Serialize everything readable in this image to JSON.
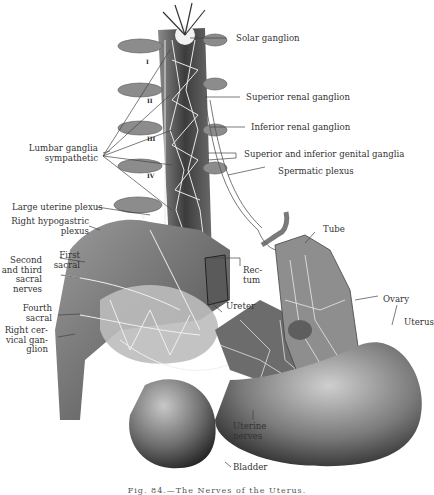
{
  "figure": {
    "caption": "Fig. 84.—The Nerves of the Uterus.",
    "vertebra_numerals": [
      "I",
      "II",
      "III",
      "IV",
      "V"
    ],
    "labels_right": {
      "solar_ganglion": "Solar ganglion",
      "superior_renal_ganglion": "Superior renal ganglion",
      "inferior_renal_ganglion": "Inferior renal ganglion",
      "genital_ganglia": "Superior and inferior genital ganglia",
      "spermatic_plexus": "Spermatic plexus",
      "tube": "Tube",
      "ovary": "Ovary",
      "uterus": "Uterus"
    },
    "labels_left": {
      "lumbar_ganglia_1": "Lumbar ganglia",
      "lumbar_ganglia_2": "sympathetic",
      "large_uterine_plexus": "Large uterine plexus",
      "right_hypogastric_1": "Right hypogastric",
      "right_hypogastric_2": "plexus",
      "first_sacral_1": "First",
      "first_sacral_2": "sacral",
      "second_third_1": "Second",
      "second_third_2": "and third",
      "second_third_3": "sacral",
      "second_third_4": "nerves",
      "fourth_sacral_1": "Fourth",
      "fourth_sacral_2": "sacral",
      "right_cervical_1": "Right cer-",
      "right_cervical_2": "vical gan-",
      "right_cervical_3": "glion"
    },
    "labels_center": {
      "rectum_1": "Rec-",
      "rectum_2": "tum",
      "ureter": "Ureter",
      "uterine_nerves_1": "Uterine",
      "uterine_nerves_2": "nerves",
      "bladder": "Bladder"
    }
  }
}
